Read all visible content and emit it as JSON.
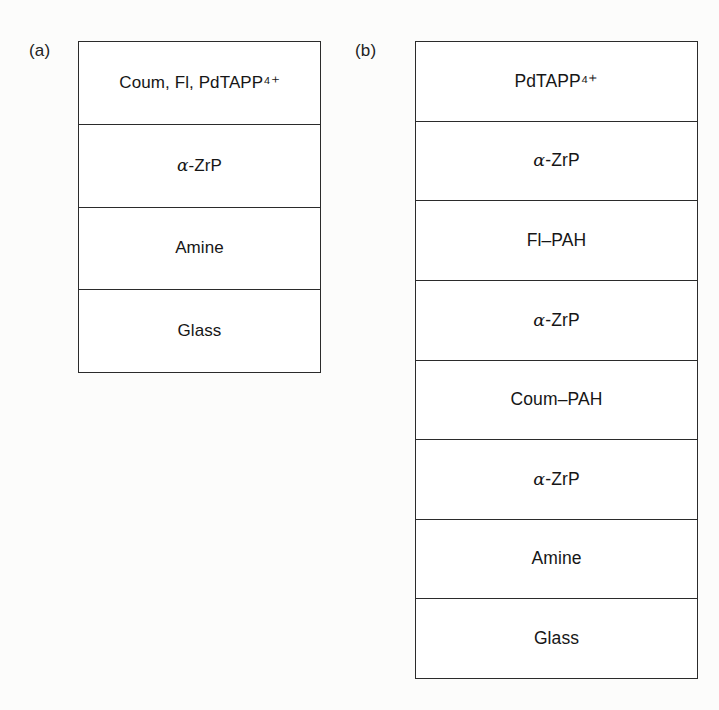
{
  "figure": {
    "background_color": "#fcfcfb",
    "line_color": "#2b2b2b",
    "text_color": "#161616"
  },
  "panels": [
    {
      "id": "a",
      "label": "(a)",
      "layers": [
        {
          "name": "assembly-layer",
          "text": "Coum, Fl, PdTAPP⁴⁺"
        },
        {
          "name": "zrp-layer",
          "text": "α-ZrP"
        },
        {
          "name": "amine-layer",
          "text": "Amine"
        },
        {
          "name": "glass-layer",
          "text": "Glass"
        }
      ]
    },
    {
      "id": "b",
      "label": "(b)",
      "layers": [
        {
          "name": "pdtapp-layer",
          "text": "PdTAPP⁴⁺"
        },
        {
          "name": "zrp-layer-1",
          "text": "α-ZrP"
        },
        {
          "name": "fl-pah-layer",
          "text": "Fl–PAH"
        },
        {
          "name": "zrp-layer-2",
          "text": "α-ZrP"
        },
        {
          "name": "coum-pah-layer",
          "text": "Coum–PAH"
        },
        {
          "name": "zrp-layer-3",
          "text": "α-ZrP"
        },
        {
          "name": "amine-layer",
          "text": "Amine"
        },
        {
          "name": "glass-layer",
          "text": "Glass"
        }
      ]
    }
  ]
}
